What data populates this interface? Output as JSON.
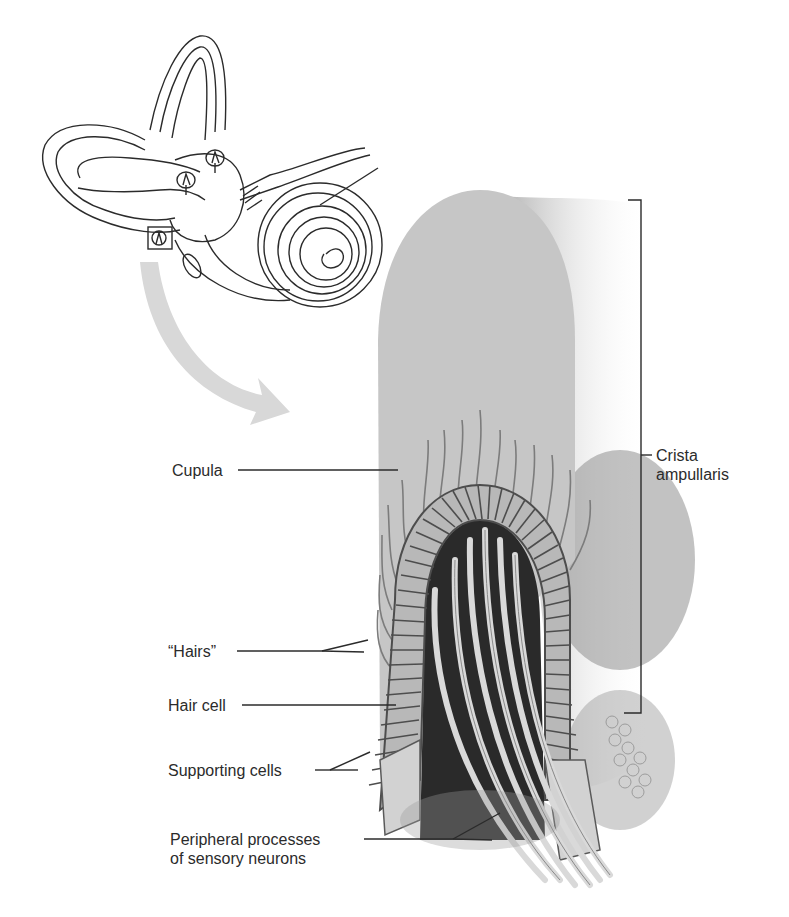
{
  "figure": {
    "inset": {
      "name": "inner-ear-overview",
      "highlight_box": "ampulla-crista-location"
    },
    "labels": {
      "cupula": "Cupula",
      "crista_line1": "Crista",
      "crista_line2": "ampullaris",
      "hairs": "“Hairs”",
      "hair_cell": "Hair cell",
      "supporting_cells": "Supporting cells",
      "peripheral_line1": "Peripheral processes",
      "peripheral_line2": "of sensory neurons"
    },
    "colors": {
      "line": "#2b2b2b",
      "cupula": "#c9c9c9",
      "cupula_shadow": "#9a9a9a",
      "cells_fill": "#b5b5b5",
      "cells_stroke": "#555555",
      "dark_core": "#2a2a2a",
      "arrow": "#d6d6d6"
    }
  }
}
